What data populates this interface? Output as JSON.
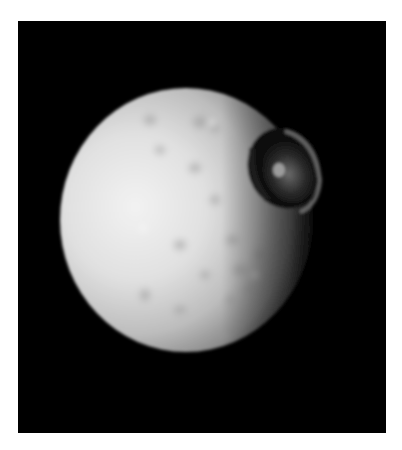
{
  "image": {
    "subject": "cratered moon with large impact crater",
    "background_color": "#000000",
    "border_color": "#ffffff",
    "colors": {
      "surface_light": "#e8e8e8",
      "surface_mid": "#b8b8b8",
      "surface_shadow": "#3a3a3a",
      "crater_shadow": "#0a0a0a"
    }
  }
}
